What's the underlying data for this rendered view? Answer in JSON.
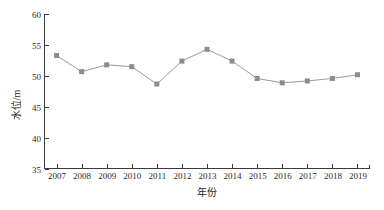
{
  "chart_data": {
    "type": "line",
    "title": "",
    "xlabel": "年份",
    "ylabel": "水位/m",
    "categories": [
      "2007",
      "2008",
      "2009",
      "2010",
      "2011",
      "2012",
      "2013",
      "2014",
      "2015",
      "2016",
      "2017",
      "2018",
      "2019"
    ],
    "x": [
      2007,
      2008,
      2009,
      2010,
      2011,
      2012,
      2013,
      2014,
      2015,
      2016,
      2017,
      2018,
      2019
    ],
    "values": [
      53.3,
      50.7,
      51.8,
      51.5,
      48.7,
      52.4,
      54.3,
      52.4,
      49.6,
      48.9,
      49.2,
      49.6,
      50.2
    ],
    "series": [
      {
        "name": "水位",
        "values": [
          53.3,
          50.7,
          51.8,
          51.5,
          48.7,
          52.4,
          54.3,
          52.4,
          49.6,
          48.9,
          49.2,
          49.6,
          50.2
        ]
      }
    ],
    "ylim": [
      35,
      60
    ],
    "yticks": [
      35,
      40,
      45,
      50,
      55,
      60
    ],
    "ytick_labels": [
      "35",
      "40",
      "45",
      "50",
      "55",
      "60"
    ],
    "xlim": [
      2006.5,
      2019.5
    ],
    "xticks": [
      2007,
      2008,
      2009,
      2010,
      2011,
      2012,
      2013,
      2014,
      2015,
      2016,
      2017,
      2018,
      2019
    ],
    "xtick_labels": [
      "2007",
      "2008",
      "2009",
      "2010",
      "2011",
      "2012",
      "2013",
      "2014",
      "2015",
      "2016",
      "2017",
      "2018",
      "2019"
    ],
    "grid": false,
    "legend": null,
    "legend_position": "none",
    "marker": "square",
    "series_color": "#8c8c8c",
    "line_color": "#9a9a9a",
    "axis_color": "#3a3a3a",
    "background_color": "#ffffff"
  }
}
